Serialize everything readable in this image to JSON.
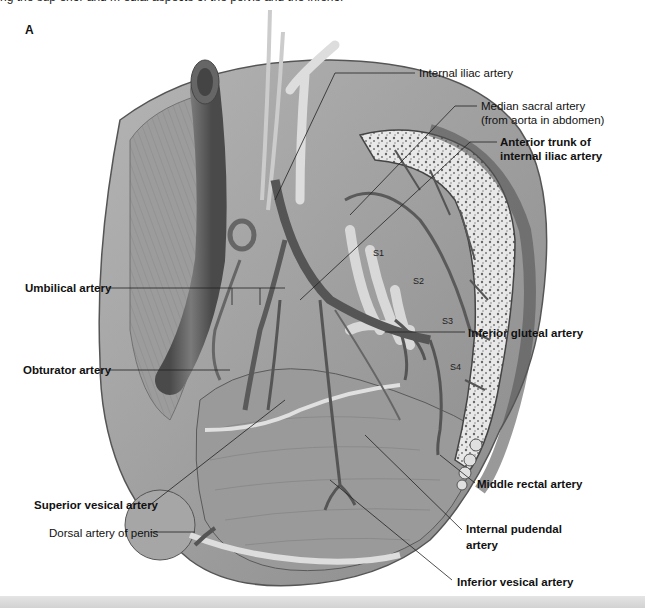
{
  "figure": {
    "panel_letter": "A",
    "top_cut_text": "ng the sup erior  and m  edial  aspects  of  the  pelvis  and  the  inferior",
    "theme_colors": {
      "muscle": "#9a9a9a",
      "muscle_dark": "#6e6e6e",
      "vessel": "#5a5a5a",
      "bone": "#e6e6e6",
      "leader_line": "#222222",
      "bottom_strip": "#d8d8d8"
    }
  },
  "labels": {
    "internal_iliac": "Internal iliac artery",
    "median_sacral_line1": "Median sacral artery",
    "median_sacral_line2": "(from aorta in abdomen)",
    "anterior_trunk_line1": "Anterior trunk of",
    "anterior_trunk_line2": "internal iliac artery",
    "umbilical": "Umbilical artery",
    "obturator": "Obturator artery",
    "inferior_gluteal": "Inferior gluteal artery",
    "superior_vesical": "Superior vesical artery",
    "dorsal_penis": "Dorsal artery of penis",
    "middle_rectal": "Middle rectal artery",
    "internal_pudendal_line1": "Internal pudendal",
    "internal_pudendal_line2": "artery",
    "inferior_vesical": "Inferior vesical artery"
  },
  "sacral_segments": [
    "S1",
    "S2",
    "S3",
    "S4"
  ]
}
